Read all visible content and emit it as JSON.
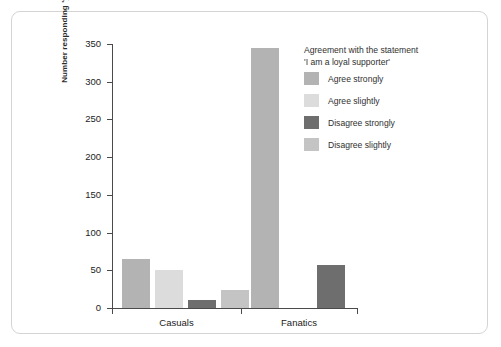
{
  "chart_data": {
    "type": "bar",
    "title": "",
    "xlabel": "",
    "ylabel": "Number responding 'yes'",
    "categories": [
      "Casuals",
      "Fanatics"
    ],
    "ylim": [
      0,
      350
    ],
    "yticks": [
      0,
      50,
      100,
      150,
      200,
      250,
      300,
      350
    ],
    "ytick_labels": [
      "0",
      "50",
      "100",
      "150",
      "200",
      "250",
      "300",
      "350"
    ],
    "grid": false,
    "legend_position": "right",
    "legend_title_lines": [
      "Agreement with the statement",
      "'I am a loyal supporter'"
    ],
    "series": [
      {
        "name": "Agree strongly",
        "color": "#b3b3b3",
        "values": [
          65,
          345
        ]
      },
      {
        "name": "Agree slightly",
        "color": "#dcdcdc",
        "values": [
          50,
          0
        ]
      },
      {
        "name": "Disagree strongly",
        "color": "#6e6e6e",
        "values": [
          10,
          57
        ]
      },
      {
        "name": "Disagree slightly",
        "color": "#c4c4c4",
        "values": [
          24,
          0
        ]
      }
    ]
  },
  "legend": {
    "title_line_1": "Agreement with the statement",
    "title_line_2": "'I am a loyal supporter'",
    "items": [
      {
        "label": "Agree strongly"
      },
      {
        "label": "Agree slightly"
      },
      {
        "label": "Disagree strongly"
      },
      {
        "label": "Disagree slightly"
      }
    ]
  },
  "axes": {
    "y_title": "Number responding 'yes'"
  }
}
